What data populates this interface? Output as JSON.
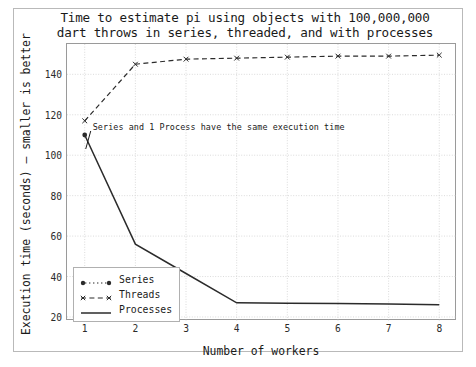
{
  "chart_data": {
    "type": "line",
    "title": "Time to estimate pi using objects with 100,000,000\ndart throws in series, threaded, and with processes",
    "xlabel": "Number of workers",
    "ylabel": "Execution time (seconds) – smaller is better",
    "x": [
      1,
      2,
      3,
      4,
      5,
      6,
      7,
      8
    ],
    "xlim": [
      0.65,
      8.35
    ],
    "ylim": [
      18,
      155
    ],
    "xticks": [
      1,
      2,
      3,
      4,
      5,
      6,
      7,
      8
    ],
    "yticks": [
      20,
      40,
      60,
      80,
      100,
      120,
      140
    ],
    "grid": true,
    "grid_style": "dotted",
    "legend_position": "lower left",
    "series": [
      {
        "name": "Series",
        "values": [
          110,
          null,
          null,
          null,
          null,
          null,
          null,
          null
        ],
        "style": "dotted",
        "marker": "circle",
        "color": "#2b2b2b"
      },
      {
        "name": "Threads",
        "values": [
          117,
          145,
          147.5,
          148,
          148.5,
          149,
          149,
          149.5
        ],
        "style": "dashed",
        "marker": "x",
        "color": "#2b2b2b"
      },
      {
        "name": "Processes",
        "values": [
          110,
          56,
          41.5,
          27,
          26.8,
          26.6,
          26.4,
          26
        ],
        "style": "solid",
        "marker": "none",
        "color": "#2b2b2b"
      }
    ],
    "annotations": [
      {
        "text": "Series and 1 Process have the same execution time",
        "x": 1,
        "y": 110
      }
    ]
  },
  "axis": {
    "ytick_labels": [
      "140",
      "120",
      "100",
      "80",
      "60",
      "40",
      "20"
    ],
    "xtick_labels": [
      "1",
      "2",
      "3",
      "4",
      "5",
      "6",
      "7",
      "8"
    ]
  },
  "legend": {
    "items": [
      {
        "label": "Series"
      },
      {
        "label": "Threads"
      },
      {
        "label": "Processes"
      }
    ]
  }
}
